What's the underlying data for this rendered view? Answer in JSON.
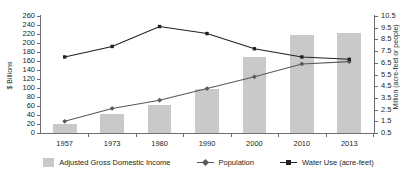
{
  "chart_data": {
    "type": "bar",
    "title": "",
    "categories": [
      "1957",
      "1973",
      "1980",
      "1990",
      "2000",
      "2010",
      "2013"
    ],
    "grid": false,
    "legend_position": "bottom",
    "axes": {
      "left": {
        "label": "$ Billions",
        "ylim": [
          0,
          260
        ],
        "tick_step": 20,
        "ticks": [
          "0",
          "20",
          "40",
          "60",
          "80",
          "100",
          "120",
          "140",
          "160",
          "180",
          "200",
          "220",
          "240",
          "260"
        ]
      },
      "right": {
        "label": "Million (acre-feet or people)",
        "ylim": [
          0.5,
          10.5
        ],
        "tick_step": 1.0,
        "ticks": [
          "0.5",
          "1.5",
          "2.5",
          "3.5",
          "4.5",
          "5.5",
          "6.5",
          "7.5",
          "8.5",
          "9.5",
          "10.5"
        ]
      },
      "x": {
        "label": ""
      }
    },
    "series": [
      {
        "name": "Adjusted Gross Domestic Income",
        "render": "bar",
        "axis": "left",
        "unit": "$ Billions",
        "color": "#c9c9c9",
        "values": [
          20,
          42,
          62,
          97,
          170,
          218,
          222
        ]
      },
      {
        "name": "Population",
        "render": "line",
        "axis": "right",
        "unit": "million people",
        "color": "#58595b",
        "marker": "diamond",
        "values": [
          1.5,
          2.6,
          3.3,
          4.3,
          5.3,
          6.4,
          6.6
        ]
      },
      {
        "name": "Water Use (acre-feet)",
        "render": "line",
        "axis": "right",
        "unit": "million acre-feet",
        "color": "#231f20",
        "marker": "square",
        "values": [
          7.0,
          7.9,
          9.6,
          9.0,
          7.7,
          7.0,
          6.8
        ]
      }
    ]
  },
  "legend": {
    "items": [
      {
        "label": "Adjusted Gross Domestic Income",
        "type": "swatch"
      },
      {
        "label": "Population",
        "type": "line-diamond"
      },
      {
        "label": "Water Use (acre-feet)",
        "type": "line-square"
      }
    ]
  }
}
